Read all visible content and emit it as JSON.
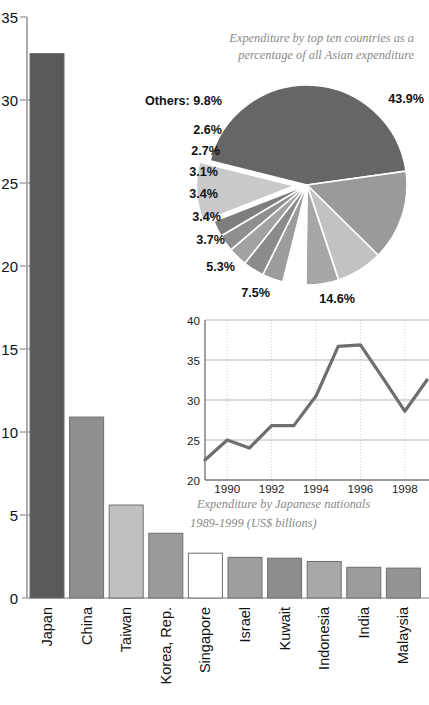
{
  "chart_data": [
    {
      "type": "bar",
      "title": "",
      "xlabel": "",
      "ylabel": "",
      "ylim": [
        0,
        35
      ],
      "yticks": [
        "0",
        "5",
        "10",
        "15",
        "20",
        "25",
        "30",
        "35"
      ],
      "grid": false,
      "categories": [
        "Japan",
        "China",
        "Taiwan",
        "Korea, Rep.",
        "Singapore",
        "Israel",
        "Kuwait",
        "Indonesia",
        "India",
        "Malaysia"
      ],
      "values": [
        32.8,
        10.9,
        5.6,
        3.9,
        2.7,
        2.45,
        2.4,
        2.2,
        1.85,
        1.8
      ],
      "bar_colors": [
        "#595959",
        "#8f8f8f",
        "#c0c0c0",
        "#9a9a9a",
        "#ffffff",
        "#9e9e9e",
        "#8d8d8d",
        "#a8a8a8",
        "#9c9c9c",
        "#949494"
      ]
    },
    {
      "type": "pie",
      "title": "Expenditure by top ten countries as a percentage of all Asian expenditure",
      "title_line1": "Expenditure by top ten countries as a",
      "title_line2": "percentage of all Asian expenditure",
      "legend": "none",
      "labels": [
        "43.9%",
        "14.6%",
        "7.5%",
        "5.3%",
        "3.7%",
        "3.4%",
        "3.4%",
        "3.1%",
        "2.7%",
        "2.6%",
        "Others: 9.8%"
      ],
      "values": [
        43.9,
        14.6,
        7.5,
        5.3,
        3.7,
        3.4,
        3.4,
        3.1,
        2.7,
        2.6,
        9.8
      ],
      "exploded": [
        "Others: 9.8%"
      ],
      "slice_colors": [
        "#666666",
        "#9a9a9a",
        "#c2c2c2",
        "#a6a6a6",
        "#ffffff",
        "#9c9c9c",
        "#8b8b8b",
        "#a2a2a2",
        "#8f8f8f",
        "#7e7e7e",
        "#c9c9c9"
      ]
    },
    {
      "type": "line",
      "title": "",
      "caption_line1": "Expenditure by Japanese nationals",
      "caption_line2": "1989-1999 (US$ billions)",
      "xlabel": "",
      "ylabel": "",
      "ylim": [
        20,
        40
      ],
      "yticks": [
        "20",
        "25",
        "30",
        "35",
        "40"
      ],
      "xticks": [
        "1990",
        "1992",
        "1994",
        "1996",
        "1998"
      ],
      "grid": true,
      "x": [
        1989,
        1990,
        1991,
        1992,
        1993,
        1994,
        1995,
        1996,
        1997,
        1998,
        1999
      ],
      "values": [
        22.5,
        25.0,
        24.0,
        26.8,
        26.8,
        30.5,
        36.7,
        36.9,
        32.8,
        28.6,
        32.5
      ],
      "line_color": "#6e6e6e"
    }
  ],
  "bar_chart": {
    "yticks": [
      "35",
      "30",
      "25",
      "20",
      "15",
      "10",
      "5",
      "0"
    ],
    "categories": [
      {
        "label": "Japan"
      },
      {
        "label": "China"
      },
      {
        "label": "Taiwan"
      },
      {
        "label": "Korea, Rep."
      },
      {
        "label": "Singapore"
      },
      {
        "label": "Israel"
      },
      {
        "label": "Kuwait"
      },
      {
        "label": "Indonesia"
      },
      {
        "label": "India"
      },
      {
        "label": "Malaysia"
      }
    ]
  },
  "pie_chart": {
    "title_line1": "Expenditure by top ten countries as a",
    "title_line2": "percentage of all Asian expenditure",
    "labels": {
      "others": "Others: 9.8%",
      "p439": "43.9%",
      "p146": "14.6%",
      "p75": "7.5%",
      "p53": "5.3%",
      "p37": "3.7%",
      "p34a": "3.4%",
      "p34b": "3.4%",
      "p31": "3.1%",
      "p27": "2.7%",
      "p26": "2.6%"
    }
  },
  "line_chart": {
    "yticks": [
      "40",
      "35",
      "30",
      "25",
      "20"
    ],
    "xticks": [
      "1990",
      "1992",
      "1994",
      "1996",
      "1998"
    ],
    "caption_line1": "Expenditure by Japanese nationals",
    "caption_line2": "1989-1999 (US$ billions)"
  }
}
